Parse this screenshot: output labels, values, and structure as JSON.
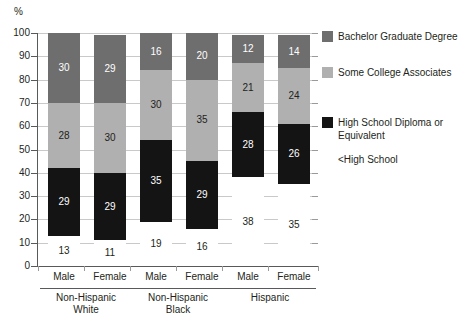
{
  "chart_data": {
    "type": "bar",
    "subtype": "stacked-100-percent",
    "title": "",
    "xlabel": "",
    "ylabel": "%",
    "ylim": [
      0,
      100
    ],
    "yticks": [
      0,
      10,
      20,
      30,
      40,
      50,
      60,
      70,
      80,
      90,
      100
    ],
    "ytick_labels": [
      "0",
      "10",
      "20",
      "30",
      "40",
      "50",
      "60",
      "70",
      "80",
      "90",
      "100"
    ],
    "grid": true,
    "legend_position": "right",
    "categories": [
      "Male",
      "Female",
      "Male",
      "Female",
      "Male",
      "Female"
    ],
    "groups": [
      {
        "label": "Non-Hispanic White",
        "line1": "Non-Hispanic",
        "line2": "White",
        "categories": [
          "Male",
          "Female"
        ]
      },
      {
        "label": "Non-Hispanic Black",
        "line1": "Non-Hispanic",
        "line2": "Black",
        "categories": [
          "Male",
          "Female"
        ]
      },
      {
        "label": "Hispanic",
        "line1": "Hispanic",
        "line2": "",
        "categories": [
          "Male",
          "Female"
        ]
      }
    ],
    "series": [
      {
        "name": "<High School",
        "color": "#ffffff",
        "values": [
          13,
          11,
          19,
          16,
          38,
          35
        ]
      },
      {
        "name": "High School Diploma or Equivalent",
        "color": "#141414",
        "values": [
          29,
          29,
          35,
          29,
          28,
          26
        ]
      },
      {
        "name": "Some College Associates",
        "color": "#b0b0b0",
        "values": [
          28,
          30,
          30,
          35,
          21,
          24
        ]
      },
      {
        "name": "Bachelor Graduate Degree",
        "color": "#6e6e6e",
        "values": [
          30,
          29,
          16,
          20,
          12,
          14
        ]
      }
    ]
  },
  "legend": {
    "items": [
      {
        "label": "Bachelor Graduate Degree",
        "color": "#6e6e6e",
        "swatch": "sw-dg"
      },
      {
        "label": "Some College Associates",
        "color": "#b0b0b0",
        "swatch": "sw-md"
      },
      {
        "label": "High School Diploma or Equivalent",
        "color": "#141414",
        "swatch": "sw-dk"
      },
      {
        "label": "<High School",
        "color": "#ffffff",
        "swatch": "sw-lt"
      }
    ]
  },
  "axis": {
    "y_unit": "%"
  }
}
